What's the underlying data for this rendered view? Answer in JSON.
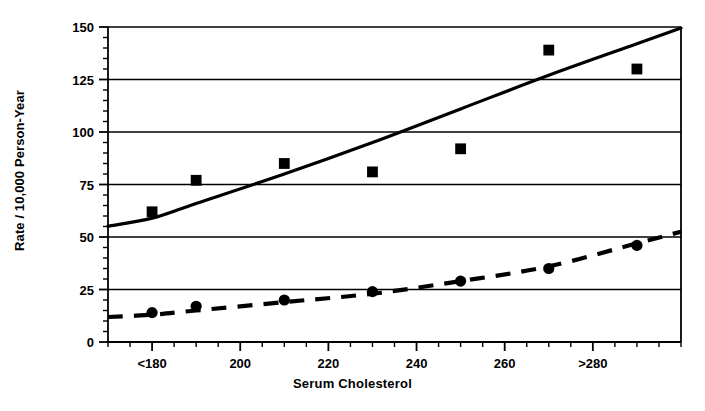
{
  "chart_data": {
    "type": "line",
    "title": "",
    "xlabel": "Serum Cholesterol",
    "ylabel": "Rate / 10,000 Person-Year",
    "xlim": [
      170,
      300
    ],
    "ylim": [
      0,
      150
    ],
    "grid": true,
    "legend": "none",
    "y_ticks": [
      0,
      25,
      50,
      75,
      100,
      125,
      150
    ],
    "y_tick_labels": [
      "0",
      "25",
      "50",
      "75",
      "100",
      "125",
      "150"
    ],
    "y_minor_tick_step": 5,
    "x_ticks": [
      180,
      200,
      220,
      240,
      260,
      280
    ],
    "x_tick_labels": [
      "<180",
      "200",
      "220",
      "240",
      "260",
      ">280"
    ],
    "x_minor_tick_step": 5,
    "x": [
      180,
      190,
      210,
      230,
      250,
      270,
      290
    ],
    "series": [
      {
        "name": "upper-series",
        "marker": "square",
        "line_style": "solid",
        "color": "#000000",
        "values": [
          62,
          77,
          85,
          81,
          92,
          139,
          130
        ],
        "fit_curve": [
          59,
          66,
          80,
          95,
          111,
          127,
          142
        ]
      },
      {
        "name": "lower-series",
        "marker": "circle",
        "line_style": "dashed",
        "color": "#000000",
        "values": [
          14,
          17,
          20,
          24,
          29,
          35,
          46
        ],
        "fit_curve": [
          13,
          15,
          19,
          23,
          29,
          36,
          47
        ]
      }
    ]
  },
  "axes": {
    "y_title": "Rate / 10,000 Person-Year",
    "x_title": "Serum Cholesterol",
    "y_labels": [
      "150",
      "125",
      "100",
      "75",
      "50",
      "25",
      "0"
    ],
    "x_labels": [
      "<180",
      "200",
      "220",
      "240",
      "260",
      ">280"
    ]
  },
  "colors": {
    "ink": "#000000",
    "background": "#ffffff",
    "gridline": "#111111"
  }
}
